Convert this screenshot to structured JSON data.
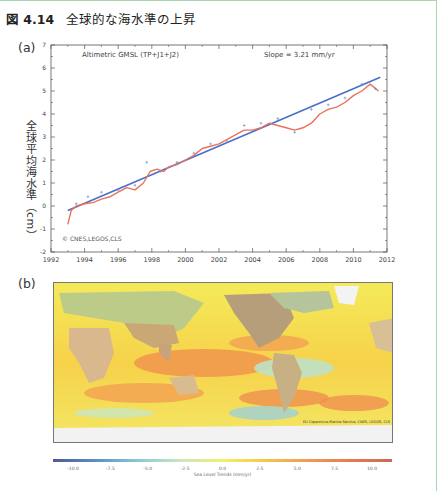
{
  "figure": {
    "number_prefix": "図",
    "number": "4.14",
    "title": "全球的な海水準の上昇"
  },
  "panel_a": {
    "label": "(a)",
    "ylabel": "全球平均海水準（cm）",
    "annotation_left": "Altimetric GMSL (TP+J1+J2)",
    "annotation_right": "Slope = 3.21 mm/yr",
    "credit": "© CNES,LEGOS,CLS"
  },
  "panel_b": {
    "label": "(b)",
    "credit": "EU Copernicus Marine Service, CNES, LEGOS, CLS",
    "colorbar_label": "Sea Level Trends (mm/yr)",
    "colorbar_ticks": [
      "-10.0",
      "-7.5",
      "-5.0",
      "-2.5",
      "0.0",
      "2.5",
      "5.0",
      "7.5",
      "10.0"
    ],
    "colorbar_colors": [
      "#4f5a8c",
      "#5b8fc8",
      "#8cc7d6",
      "#c9e6c0",
      "#f2f06a",
      "#f7c54b",
      "#f39a55",
      "#ea7a4f",
      "#c9695a"
    ]
  },
  "chart_data": [
    {
      "type": "line",
      "title": "Altimetric GMSL (TP+J1+J2)",
      "annotation": "Slope = 3.21 mm/yr",
      "xlabel": "",
      "ylabel": "全球平均海水準（cm）",
      "xlim": [
        1992,
        2012
      ],
      "ylim": [
        -2,
        7
      ],
      "xticks": [
        "1992",
        "1994",
        "1996",
        "1998",
        "2000",
        "2002",
        "2004",
        "2006",
        "2008",
        "2010",
        "2012"
      ],
      "yticks": [
        "-2",
        "-1",
        "0",
        "1",
        "2",
        "3",
        "4",
        "5",
        "6",
        "7"
      ],
      "grid": false,
      "series": [
        {
          "name": "GMSL (smoothed, red)",
          "color": "#e8735a",
          "x": [
            1993.0,
            1993.2,
            1993.5,
            1994.0,
            1994.5,
            1995.0,
            1995.5,
            1996.0,
            1996.5,
            1997.0,
            1997.5,
            1997.9,
            1998.3,
            1998.7,
            1999.0,
            1999.5,
            2000.0,
            2000.5,
            2001.0,
            2001.5,
            2002.0,
            2002.5,
            2003.0,
            2003.5,
            2004.0,
            2004.5,
            2005.0,
            2005.5,
            2006.0,
            2006.5,
            2007.0,
            2007.5,
            2008.0,
            2008.5,
            2009.0,
            2009.5,
            2010.0,
            2010.5,
            2011.0,
            2011.5
          ],
          "y": [
            -0.8,
            -0.2,
            0.0,
            0.1,
            0.15,
            0.3,
            0.4,
            0.6,
            0.8,
            0.7,
            1.0,
            1.5,
            1.6,
            1.5,
            1.7,
            1.8,
            2.0,
            2.2,
            2.5,
            2.6,
            2.7,
            2.9,
            3.1,
            3.3,
            3.3,
            3.4,
            3.6,
            3.5,
            3.4,
            3.3,
            3.4,
            3.6,
            4.0,
            4.2,
            4.3,
            4.5,
            4.8,
            5.0,
            5.3,
            5.0
          ]
        },
        {
          "name": "Linear trend (blue)",
          "color": "#4a6fc7",
          "x": [
            1993.0,
            2011.6
          ],
          "y": [
            -0.2,
            5.6
          ]
        },
        {
          "name": "10-day data points (blue crosses)",
          "color": "#6e8fd6",
          "x": [
            1993.5,
            1994.2,
            1995.0,
            1996.0,
            1997.0,
            1997.7,
            1998.5,
            1999.5,
            2000.5,
            2001.5,
            2002.5,
            2003.5,
            2004.5,
            2005.5,
            2006.5,
            2007.5,
            2008.5,
            2009.5,
            2010.5,
            2011.3
          ],
          "y": [
            0.1,
            0.4,
            0.6,
            0.7,
            0.9,
            1.9,
            1.5,
            1.9,
            2.3,
            2.7,
            2.8,
            3.5,
            3.6,
            3.8,
            3.2,
            4.2,
            4.4,
            4.7,
            5.3,
            5.1
          ]
        }
      ]
    },
    {
      "type": "heatmap",
      "title": "Sea Level Trends (mm/yr)",
      "colorbar_range": [
        -10.0,
        10.0
      ],
      "colorbar_ticks": [
        -10.0,
        -7.5,
        -5.0,
        -2.5,
        0.0,
        2.5,
        5.0,
        7.5,
        10.0
      ],
      "description": "Global map of regional sea level trends; strongest rise (orange/red) in western Pacific and Indian Ocean, lower trends (blue/green) in eastern Pacific."
    }
  ]
}
